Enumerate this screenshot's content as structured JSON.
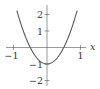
{
  "chart_data": {
    "type": "line",
    "title": "",
    "xlabel": "x",
    "ylabel": "",
    "function": "y = 4x^2 - 1",
    "series": [
      {
        "name": "parabola",
        "x": [
          -0.9,
          -0.8,
          -0.7,
          -0.6,
          -0.5,
          -0.4,
          -0.3,
          -0.2,
          -0.1,
          0,
          0.1,
          0.2,
          0.3,
          0.4,
          0.5,
          0.6,
          0.7,
          0.8,
          0.9
        ],
        "y": [
          2.24,
          1.56,
          0.96,
          0.44,
          0,
          -0.36,
          -0.64,
          -0.84,
          -0.96,
          -1,
          -0.96,
          -0.84,
          -0.64,
          -0.36,
          0,
          0.44,
          0.96,
          1.56,
          2.24
        ]
      }
    ],
    "xlim": [
      -1.2,
      1.2
    ],
    "ylim": [
      -2.3,
      2.6
    ],
    "x_ticks": [
      {
        "value": -1,
        "label": "−1"
      },
      {
        "value": 1,
        "label": "1"
      }
    ],
    "y_ticks": [
      {
        "value": 2,
        "label": "2"
      },
      {
        "value": 1,
        "label": "1"
      },
      {
        "value": -1,
        "label": "−1"
      },
      {
        "value": -2,
        "label": "−2"
      }
    ],
    "grid": false,
    "legend": "none",
    "colors": {
      "curve": "#5a5a5a",
      "axis": "#555555",
      "text": "#333333"
    }
  }
}
